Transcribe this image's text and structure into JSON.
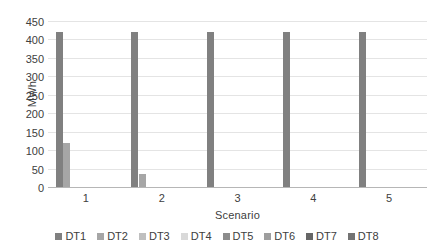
{
  "chart_data": {
    "type": "bar",
    "title": "",
    "subtitle": "",
    "xlabel": "Scenario",
    "ylabel": "MWh",
    "categories": [
      "1",
      "2",
      "3",
      "4",
      "5"
    ],
    "ylim": [
      0,
      450
    ],
    "yticks": [
      0,
      50,
      100,
      150,
      200,
      250,
      300,
      350,
      400,
      450
    ],
    "ytick_labels": [
      "0",
      "50",
      "100",
      "150",
      "200",
      "250",
      "300",
      "350",
      "400",
      "450"
    ],
    "grid": true,
    "legend_position": "bottom",
    "series": [
      {
        "name": "DT1",
        "color": "#808080",
        "values": [
          420,
          420,
          420,
          420,
          420
        ]
      },
      {
        "name": "DT2",
        "color": "#a6a6a6",
        "values": [
          120,
          35,
          0,
          0,
          0
        ]
      },
      {
        "name": "DT3",
        "color": "#bfbfbf",
        "values": [
          0,
          0,
          0,
          0,
          0
        ]
      },
      {
        "name": "DT4",
        "color": "#d9d9d9",
        "values": [
          0,
          0,
          0,
          0,
          0
        ]
      },
      {
        "name": "DT5",
        "color": "#8c8c8c",
        "values": [
          0,
          0,
          0,
          0,
          0
        ]
      },
      {
        "name": "DT6",
        "color": "#9e9e9e",
        "values": [
          0,
          0,
          0,
          0,
          0
        ]
      },
      {
        "name": "DT7",
        "color": "#666666",
        "values": [
          0,
          0,
          0,
          0,
          0
        ]
      },
      {
        "name": "DT8",
        "color": "#737373",
        "values": [
          0,
          0,
          0,
          0,
          0
        ]
      }
    ]
  },
  "axes": {
    "y_title": "MWh",
    "x_title": "Scenario"
  }
}
